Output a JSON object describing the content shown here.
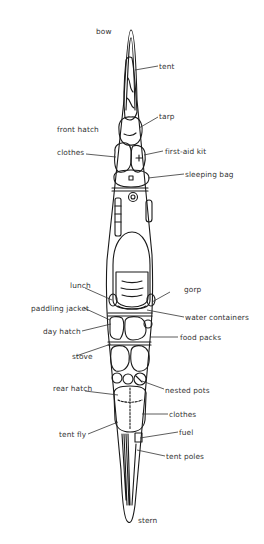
{
  "diagram": {
    "colors": {
      "ink": "#1a1a1a",
      "label": "#333333",
      "background": "#ffffff"
    },
    "labels": {
      "bow": "bow",
      "stern": "stern",
      "tent": "tent",
      "tarp": "tarp",
      "front_hatch": "front hatch",
      "clothes_front": "clothes",
      "first_aid_kit": "first-aid kit",
      "sleeping_bag": "sleeping bag",
      "lunch": "lunch",
      "gorp": "gorp",
      "paddling_jacket": "paddling jacket",
      "water_containers": "water containers",
      "day_hatch": "day hatch",
      "food_packs": "food packs",
      "stove": "stove",
      "rear_hatch": "rear hatch",
      "nested_pots": "nested pots",
      "clothes_rear": "clothes",
      "tent_fly": "tent fly",
      "fuel": "fuel",
      "tent_poles": "tent poles"
    }
  }
}
